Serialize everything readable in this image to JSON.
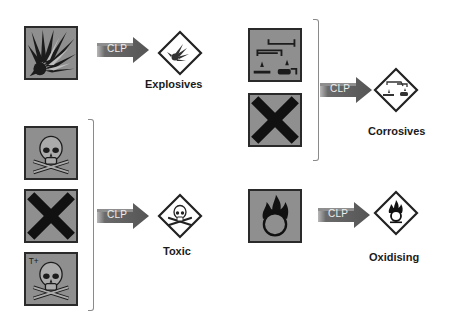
{
  "diagram": {
    "title": "",
    "arrow_label": "CLP",
    "colors": {
      "old_symbol_bg": "#8f8f8f",
      "symbol_ink": "#1c1c1c",
      "arrow_dark": "#5a5a5a",
      "arrow_light": "#b8b8b8",
      "diamond_border": "#222222",
      "bracket": "#8a8a8a"
    },
    "groups": [
      {
        "name": "Explosives",
        "old_symbols": [
          {
            "icon": "exploding-bomb-icon"
          }
        ],
        "arrow_label": "CLP",
        "new_pictogram": "ghs-exploding-bomb-icon",
        "label": "Explosives"
      },
      {
        "name": "Corrosives",
        "old_symbols": [
          {
            "icon": "corrosion-icon"
          },
          {
            "icon": "saltire-x-icon"
          }
        ],
        "arrow_label": "CLP",
        "new_pictogram": "ghs-corrosion-icon",
        "label": "Corrosives"
      },
      {
        "name": "Toxic",
        "old_symbols": [
          {
            "icon": "skull-crossbones-icon"
          },
          {
            "icon": "saltire-x-icon"
          },
          {
            "icon": "skull-crossbones-icon",
            "badge": "T+"
          }
        ],
        "arrow_label": "CLP",
        "new_pictogram": "ghs-skull-crossbones-icon",
        "label": "Toxic"
      },
      {
        "name": "Oxidising",
        "old_symbols": [
          {
            "icon": "flame-over-circle-icon"
          }
        ],
        "arrow_label": "CLP",
        "new_pictogram": "ghs-flame-over-circle-icon",
        "label": "Oxidising"
      }
    ]
  }
}
